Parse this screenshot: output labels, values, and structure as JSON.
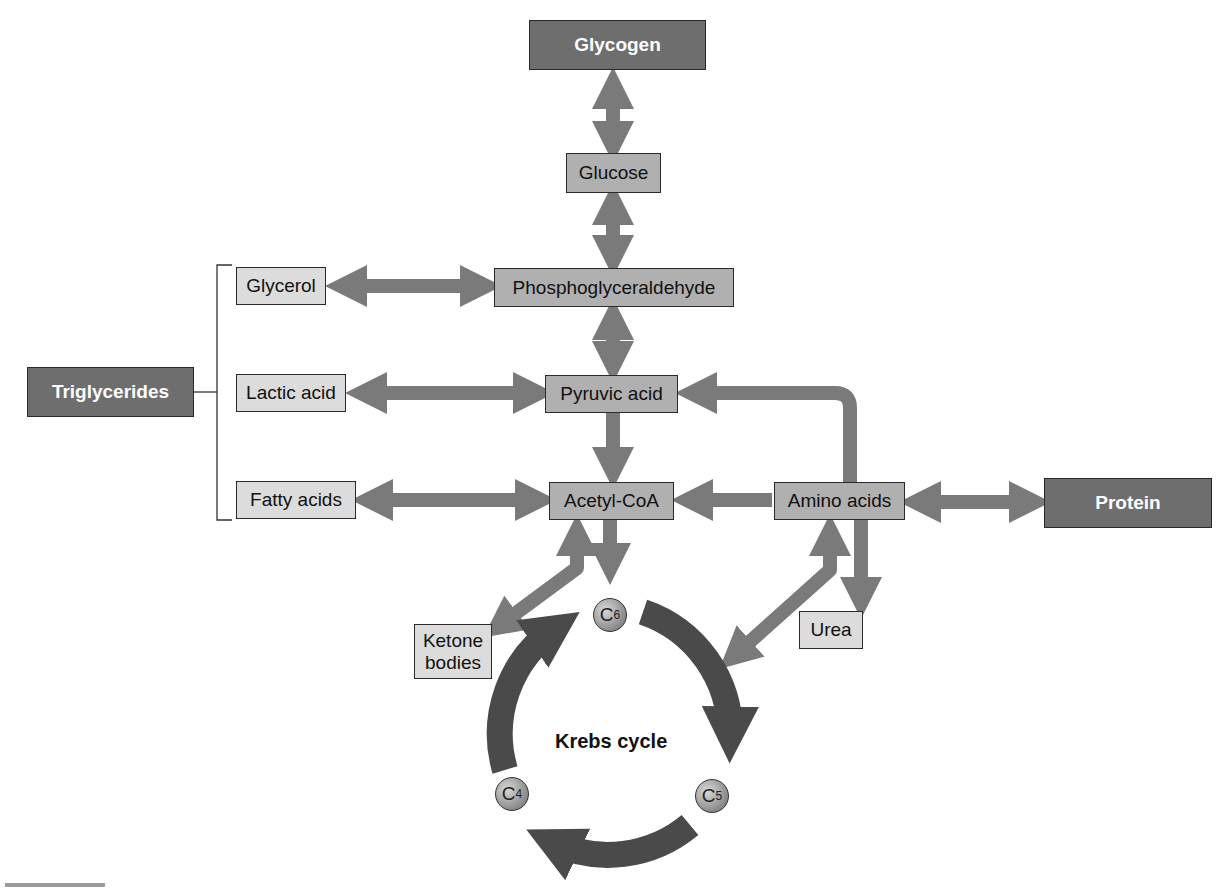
{
  "diagram": {
    "colors": {
      "dark_box": "#6e6e6e",
      "mid_box": "#b0b0b0",
      "light_box": "#dcdcdc",
      "arrow": "#7a7a7a",
      "cycle_arrow": "#4a4a4a"
    },
    "nodes": {
      "glycogen": "Glycogen",
      "glucose": "Glucose",
      "phosphoglyceraldehyde": "Phosphoglyceraldehyde",
      "glycerol": "Glycerol",
      "triglycerides": "Triglycerides",
      "lactic_acid": "Lactic acid",
      "pyruvic_acid": "Pyruvic acid",
      "fatty_acids": "Fatty acids",
      "acetyl_coa": "Acetyl-CoA",
      "amino_acids": "Amino acids",
      "protein": "Protein",
      "ketone_bodies_line1": "Ketone",
      "ketone_bodies_line2": "bodies",
      "urea": "Urea"
    },
    "krebs": {
      "label": "Krebs cycle",
      "c6": "C",
      "c6_sub": "6",
      "c5": "C",
      "c5_sub": "5",
      "c4": "C",
      "c4_sub": "4"
    },
    "edges": [
      {
        "from": "Glycogen",
        "to": "Glucose",
        "type": "bidirectional"
      },
      {
        "from": "Glucose",
        "to": "Phosphoglyceraldehyde",
        "type": "bidirectional"
      },
      {
        "from": "Glycerol",
        "to": "Phosphoglyceraldehyde",
        "type": "bidirectional"
      },
      {
        "from": "Phosphoglyceraldehyde",
        "to": "Pyruvic acid",
        "type": "bidirectional"
      },
      {
        "from": "Lactic acid",
        "to": "Pyruvic acid",
        "type": "bidirectional"
      },
      {
        "from": "Pyruvic acid",
        "to": "Acetyl-CoA",
        "type": "directed"
      },
      {
        "from": "Fatty acids",
        "to": "Acetyl-CoA",
        "type": "bidirectional"
      },
      {
        "from": "Amino acids",
        "to": "Acetyl-CoA",
        "type": "directed"
      },
      {
        "from": "Amino acids",
        "to": "Pyruvic acid",
        "type": "directed"
      },
      {
        "from": "Amino acids",
        "to": "Protein",
        "type": "bidirectional"
      },
      {
        "from": "Amino acids",
        "to": "Urea",
        "type": "directed"
      },
      {
        "from": "Acetyl-CoA",
        "to": "Krebs cycle",
        "type": "directed"
      },
      {
        "from": "Acetyl-CoA",
        "to": "Ketone bodies",
        "type": "bidirectional"
      },
      {
        "from": "Krebs cycle",
        "to": "Amino acids",
        "type": "bidirectional"
      },
      {
        "from": "Triglycerides",
        "to": [
          "Glycerol",
          "Lactic acid",
          "Fatty acids"
        ],
        "type": "bracket"
      }
    ]
  }
}
